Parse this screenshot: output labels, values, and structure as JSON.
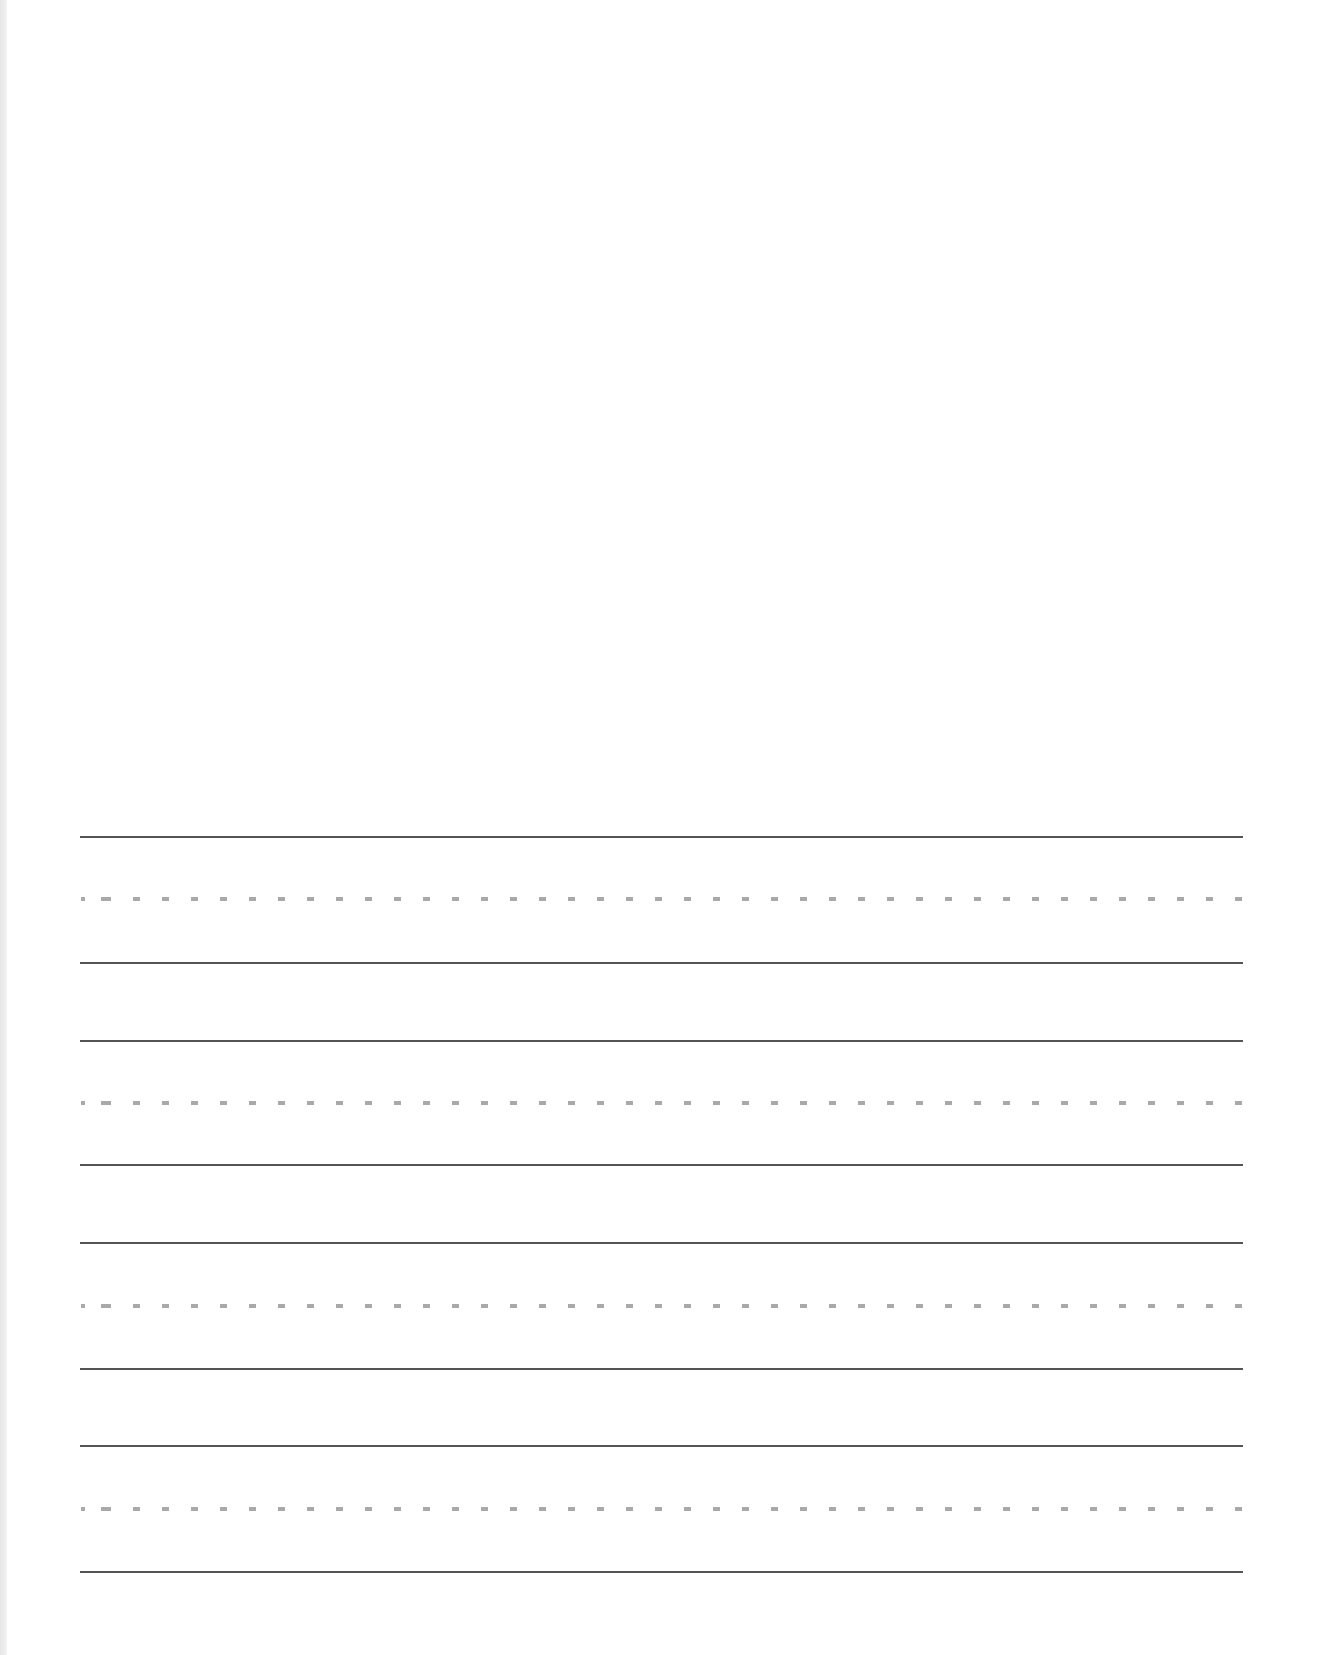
{
  "page": {
    "type": "handwriting-practice-sheet",
    "background_color": "#ffffff",
    "drawing_area": {
      "label": "",
      "blank": true
    },
    "line_style": {
      "solid_color": "#555555",
      "dashed_color": "#a9a9a9",
      "line_left_x": 80,
      "line_right_x": 1243
    },
    "line_groups": [
      {
        "top_y": 837,
        "mid_y": 899,
        "bottom_y": 963
      },
      {
        "top_y": 1041,
        "mid_y": 1103,
        "bottom_y": 1165
      },
      {
        "top_y": 1243,
        "mid_y": 1306,
        "bottom_y": 1369
      },
      {
        "top_y": 1446,
        "mid_y": 1509,
        "bottom_y": 1572
      }
    ]
  }
}
